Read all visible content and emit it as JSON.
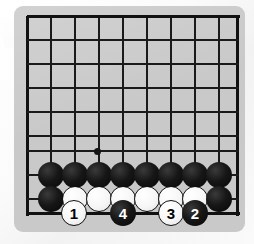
{
  "diagram": {
    "kind": "go-board-diagram",
    "board_color": "#c9c9c9",
    "line_color": "#1a1a1a",
    "page_background": "#fdfdfd",
    "black_stone_color": "#111111",
    "white_stone_color": "#f7f7f7"
  },
  "board": {
    "left": 14,
    "top": 6,
    "width": 231,
    "height": 226,
    "grid_spacing": 24,
    "vertical_lines_x": [
      27,
      51,
      75,
      99,
      123,
      147,
      171,
      195,
      219,
      237
    ],
    "horizontal_lines_y": [
      16,
      40,
      64,
      88,
      112,
      136,
      151,
      175,
      199,
      213
    ],
    "left_edge_x": 27,
    "right_edge_x": 237,
    "top_edge_y": 16,
    "bottom_edge_y": 213,
    "star_points": [
      {
        "name": "star-point-center",
        "x": 97,
        "y": 151
      }
    ]
  },
  "stones": {
    "plain": [
      {
        "name": "black-stone-r1-c1",
        "color": "black",
        "x": 51,
        "y": 175
      },
      {
        "name": "black-stone-r1-c2",
        "color": "black",
        "x": 75,
        "y": 175
      },
      {
        "name": "black-stone-r1-c3",
        "color": "black",
        "x": 99,
        "y": 175
      },
      {
        "name": "black-stone-r1-c4",
        "color": "black",
        "x": 123,
        "y": 175
      },
      {
        "name": "black-stone-r1-c5",
        "color": "black",
        "x": 147,
        "y": 175
      },
      {
        "name": "black-stone-r1-c6",
        "color": "black",
        "x": 171,
        "y": 175
      },
      {
        "name": "black-stone-r1-c7",
        "color": "black",
        "x": 195,
        "y": 175
      },
      {
        "name": "black-stone-r1-c8",
        "color": "black",
        "x": 219,
        "y": 175
      },
      {
        "name": "black-stone-r2-c1",
        "color": "black",
        "x": 51,
        "y": 199
      },
      {
        "name": "white-stone-r2-c2",
        "color": "white",
        "x": 75,
        "y": 199
      },
      {
        "name": "white-stone-r2-c3",
        "color": "white",
        "x": 99,
        "y": 199
      },
      {
        "name": "white-stone-r2-c4",
        "color": "white",
        "x": 123,
        "y": 199
      },
      {
        "name": "white-stone-r2-c5",
        "color": "white",
        "x": 147,
        "y": 199
      },
      {
        "name": "white-stone-r2-c6",
        "color": "white",
        "x": 171,
        "y": 199
      },
      {
        "name": "white-stone-r2-c7",
        "color": "white",
        "x": 195,
        "y": 199
      },
      {
        "name": "black-stone-r2-c8",
        "color": "black",
        "x": 219,
        "y": 199
      }
    ],
    "numbered": [
      {
        "name": "move-stone-1",
        "label": "1",
        "color": "white",
        "x": 74,
        "y": 213
      },
      {
        "name": "move-stone-4",
        "label": "4",
        "color": "black",
        "x": 123,
        "y": 213
      },
      {
        "name": "move-stone-3",
        "label": "3",
        "color": "white",
        "x": 171,
        "y": 213
      },
      {
        "name": "move-stone-2",
        "label": "2",
        "color": "black",
        "x": 195,
        "y": 213
      }
    ]
  }
}
